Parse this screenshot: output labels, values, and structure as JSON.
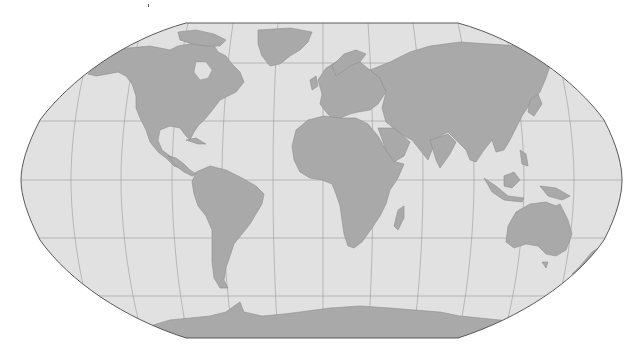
{
  "map": {
    "projection": "Robinson",
    "colors": {
      "ocean": "#e1e1e1",
      "land": "#a9a9a9",
      "coastline": "#8e8e8e",
      "graticule": "#8f8f8f",
      "outline": "#5a5a5a",
      "background": "#ffffff"
    },
    "graticule": {
      "parallel_step_deg": 30,
      "meridian_step_deg": 30
    },
    "continents": [
      "North America",
      "Greenland",
      "South America",
      "Europe",
      "Africa",
      "Asia",
      "Australia",
      "Antarctica",
      "New Zealand",
      "Madagascar"
    ]
  }
}
